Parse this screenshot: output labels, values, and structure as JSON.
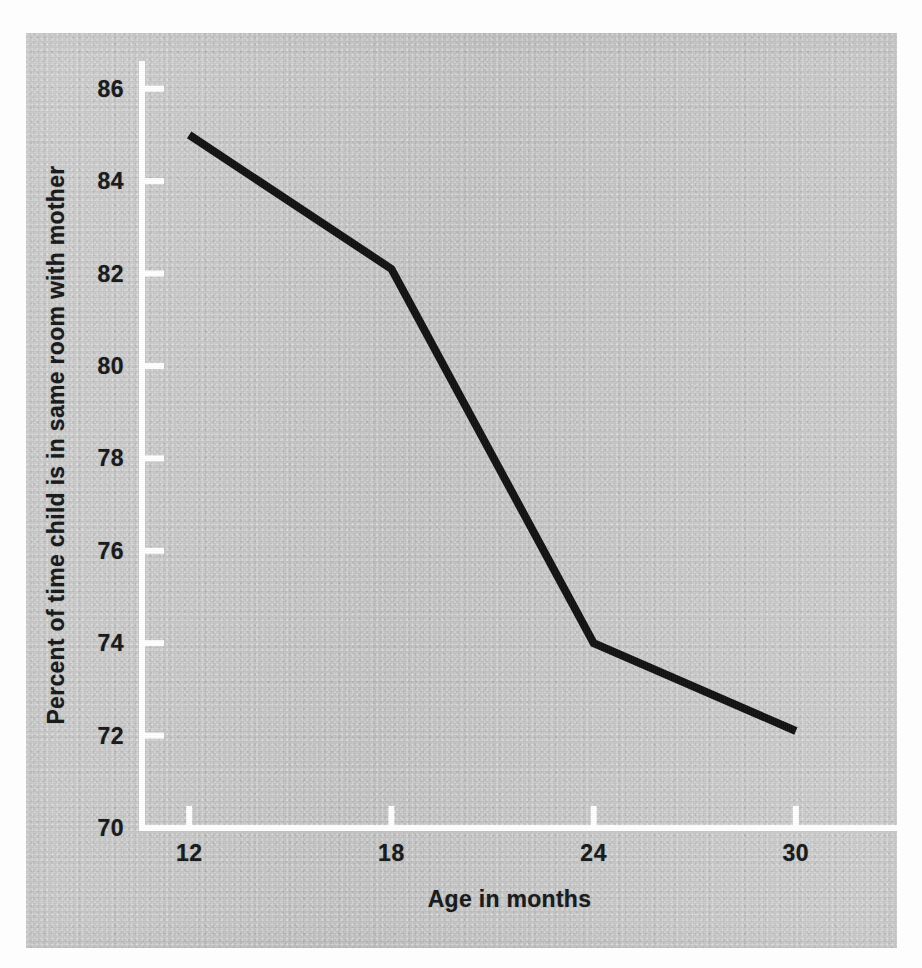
{
  "figure": {
    "background_color": "#c8c8c8",
    "page_color": "#fdfdfd",
    "axis_color": "#ffffff",
    "text_color": "#17181a",
    "series_color": "#121212"
  },
  "chart_data": {
    "type": "line",
    "title": "",
    "subtitle": "",
    "xlabel": "Age in months",
    "ylabel": "Percent of time child is in same room with mother",
    "x": [
      12,
      18,
      24,
      30
    ],
    "values": [
      85.0,
      82.1,
      74.0,
      72.1
    ],
    "series": [
      {
        "name": "Percent of time child is in same room with mother",
        "x": [
          12,
          18,
          24,
          30
        ],
        "values": [
          85.0,
          82.1,
          74.0,
          72.1
        ],
        "color": "#121212",
        "line_width": 8,
        "markers": false
      }
    ],
    "xlim": [
      10.6,
      33.0
    ],
    "ylim": [
      70,
      86.6
    ],
    "xticks": [
      12,
      18,
      24,
      30
    ],
    "xtick_labels": [
      "12",
      "18",
      "24",
      "30"
    ],
    "yticks": [
      70,
      72,
      74,
      76,
      78,
      80,
      82,
      84,
      86
    ],
    "ytick_labels": [
      "70",
      "72",
      "74",
      "76",
      "78",
      "80",
      "82",
      "84",
      "86"
    ],
    "grid": false,
    "legend": null,
    "legend_position": "none",
    "annotations": [],
    "tick_direction": "in",
    "spines": [
      "left",
      "bottom"
    ]
  }
}
